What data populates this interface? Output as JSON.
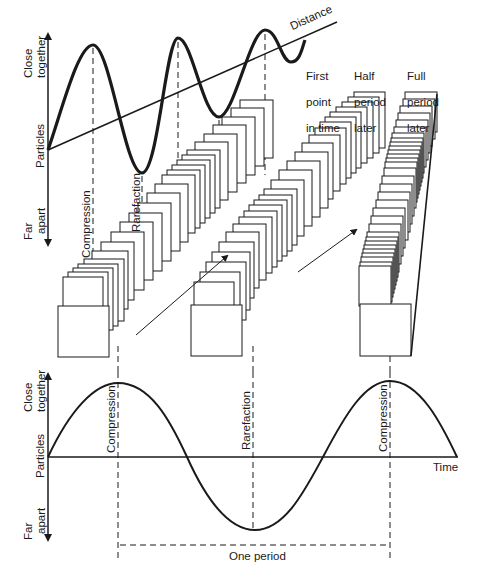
{
  "top_graph": {
    "y_axis": {
      "top_label": "Close together",
      "top_label_lines": [
        "Close",
        "together"
      ],
      "middle_label": "Particles",
      "bottom_label": "Far apart",
      "bottom_label_lines": [
        "Far",
        "apart"
      ]
    },
    "x_label": "Distance",
    "markers": [
      "Compression",
      "Rarefaction"
    ]
  },
  "stacks": [
    {
      "label": "First point in time",
      "lines": [
        "First",
        "point",
        "in time"
      ]
    },
    {
      "label": "Half period later",
      "lines": [
        "Half",
        "period",
        "later"
      ]
    },
    {
      "label": "Full period later",
      "lines": [
        "Full",
        "period",
        "later"
      ]
    }
  ],
  "bottom_graph": {
    "y_axis": {
      "top_label_lines": [
        "Close",
        "together"
      ],
      "middle_label": "Particles",
      "bottom_label_lines": [
        "Far",
        "apart"
      ]
    },
    "x_label": "Time",
    "markers": [
      "Compression",
      "Rarefaction",
      "Compression"
    ],
    "period_label": "One period"
  },
  "colors": {
    "ink": "#1a1a1a",
    "background": "#ffffff"
  }
}
